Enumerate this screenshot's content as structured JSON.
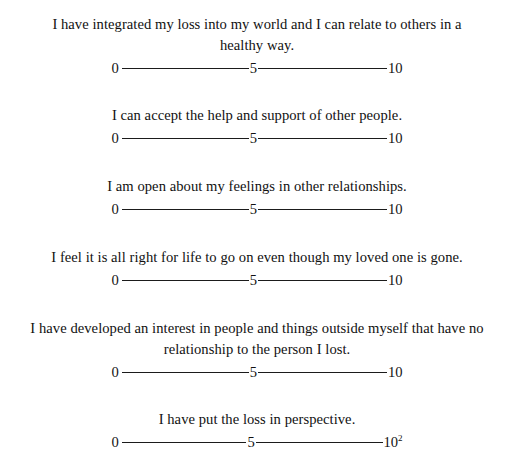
{
  "page": {
    "background_color": "#ffffff",
    "text_color": "#111111",
    "rule_color": "#1b1b1b",
    "footnote_marker": "2"
  },
  "scale": {
    "low_label": "0",
    "mid_label": "5",
    "high_label": "10",
    "min": 0,
    "mid": 5,
    "max": 10
  },
  "items": [
    {
      "statement": "I have integrated my loss into my world and I can relate to others in a healthy way.",
      "low": "0",
      "mid": "5",
      "high": "10",
      "footnote": ""
    },
    {
      "statement": "I can accept the help and support of other people.",
      "low": "0",
      "mid": "5",
      "high": "10",
      "footnote": ""
    },
    {
      "statement": "I am open about my feelings in other relationships.",
      "low": "0",
      "mid": "5",
      "high": "10",
      "footnote": ""
    },
    {
      "statement": "I feel it is all right for life to go on even though my loved one is gone.",
      "low": "0",
      "mid": "5",
      "high": "10",
      "footnote": ""
    },
    {
      "statement": "I have developed an interest in people and things outside myself that have no relationship to the person I lost.",
      "low": "0",
      "mid": "5",
      "high": "10",
      "footnote": ""
    },
    {
      "statement": "I have put the loss in perspective.",
      "low": "0",
      "mid": "5",
      "high": "10",
      "footnote": "2"
    }
  ]
}
